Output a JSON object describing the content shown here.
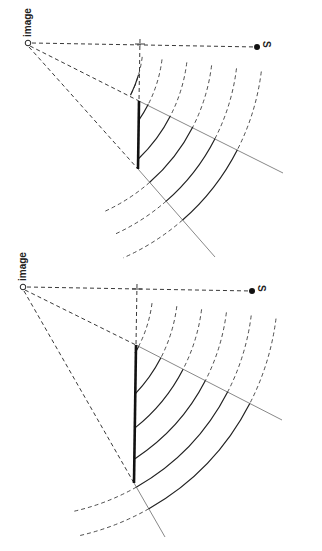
{
  "colors": {
    "ink": "#222222",
    "ray": "#888888",
    "background": "#ffffff"
  },
  "panels": [
    {
      "id": "top",
      "image_label": "image",
      "source_label": "S",
      "image_point": [
        28,
        43
      ],
      "source_point": [
        257,
        47
      ],
      "cross_point": [
        140,
        44
      ],
      "mirror": [
        [
          139,
          101
        ],
        [
          138,
          169
        ]
      ],
      "ray_ends": [
        [
          283,
          173
        ],
        [
          215,
          257
        ]
      ],
      "arc_radii": [
        115,
        135,
        160,
        185,
        210,
        235
      ]
    },
    {
      "id": "bottom",
      "image_label": "image",
      "source_label": "S",
      "image_point": [
        23,
        287
      ],
      "source_point": [
        252,
        291
      ],
      "cross_point": [
        137,
        289
      ],
      "mirror": [
        [
          136,
          345
        ],
        [
          134,
          483
        ]
      ],
      "ray_ends": [
        [
          282,
          420
        ],
        [
          165,
          537
        ]
      ],
      "arc_radii": [
        130,
        155,
        180,
        205,
        230,
        255
      ]
    }
  ]
}
